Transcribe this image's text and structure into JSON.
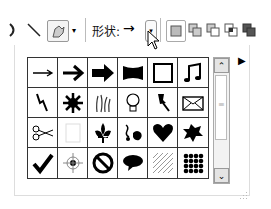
{
  "toolbar": {
    "shape_label": "形状:",
    "current_shape_glyph": "→",
    "dropdown_glyph": "▾",
    "buttons": [
      "arc-tool",
      "line-tool",
      "custom-shape-tool",
      "shape-dropdown",
      "new-layer",
      "add-to-area",
      "subtract-from-area",
      "intersect-area",
      "exclude-overlap"
    ]
  },
  "panel": {
    "menu_glyph": "▶",
    "shapes": [
      [
        "arrow-thin",
        "arrow-bold",
        "arrow-block",
        "banner",
        "frame",
        "music-note"
      ],
      [
        "lightning",
        "starburst",
        "grass",
        "lightbulb",
        "pushpin",
        "envelope"
      ],
      [
        "scissors",
        "blank",
        "fleur-de-lis",
        "ornament",
        "heart",
        "splat"
      ],
      [
        "checkmark",
        "target",
        "no-sign",
        "speech-bubble",
        "hatch-pattern",
        "dots-pattern"
      ]
    ],
    "scroll_up": "⌃",
    "scroll_down": "⌄",
    "grip": "≡"
  }
}
